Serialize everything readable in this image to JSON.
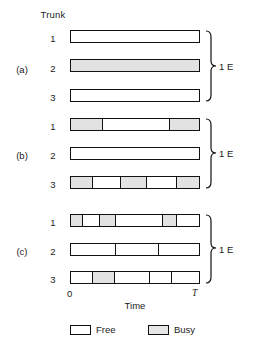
{
  "figure": {
    "trunk_header": "Trunk",
    "axis": {
      "start_label": "0",
      "end_label": "T",
      "title": "Time"
    },
    "legend": [
      {
        "label": "Free",
        "swatch": "free-swatch",
        "fill": "#ffffff"
      },
      {
        "label": "Busy",
        "swatch": "busy-swatch",
        "fill": "#e6e6e6"
      }
    ],
    "colors": {
      "busy": "#e2e2e2",
      "free": "#ffffff",
      "outline": "#111111"
    },
    "groups": [
      {
        "label": "(a)",
        "brace_label": "1 E",
        "rows": [
          {
            "trunk": "1",
            "segments": [
              {
                "state": "Free",
                "width": 100
              }
            ]
          },
          {
            "trunk": "2",
            "segments": [
              {
                "state": "Busy",
                "width": 100
              }
            ]
          },
          {
            "trunk": "3",
            "segments": [
              {
                "state": "Free",
                "width": 100
              }
            ]
          }
        ]
      },
      {
        "label": "(b)",
        "brace_label": "1 E",
        "rows": [
          {
            "trunk": "1",
            "segments": [
              {
                "state": "Busy",
                "width": 25
              },
              {
                "state": "Free",
                "width": 52
              },
              {
                "state": "Busy",
                "width": 23
              }
            ]
          },
          {
            "trunk": "2",
            "segments": [
              {
                "state": "Free",
                "width": 100
              }
            ]
          },
          {
            "trunk": "3",
            "segments": [
              {
                "state": "Busy",
                "width": 17
              },
              {
                "state": "Free",
                "width": 22
              },
              {
                "state": "Busy",
                "width": 20
              },
              {
                "state": "Free",
                "width": 24
              },
              {
                "state": "Busy",
                "width": 17
              }
            ]
          }
        ]
      },
      {
        "label": "(c)",
        "brace_label": "1 E",
        "rows": [
          {
            "trunk": "1",
            "segments": [
              {
                "state": "Busy",
                "width": 9
              },
              {
                "state": "Free",
                "width": 14
              },
              {
                "state": "Busy",
                "width": 12
              },
              {
                "state": "Free",
                "width": 37
              },
              {
                "state": "Busy",
                "width": 11
              },
              {
                "state": "Free",
                "width": 17
              }
            ]
          },
          {
            "trunk": "2",
            "segments": [
              {
                "state": "Free",
                "width": 35
              },
              {
                "state": "Free",
                "width": 34
              },
              {
                "state": "Free",
                "width": 31
              }
            ]
          },
          {
            "trunk": "3",
            "segments": [
              {
                "state": "Free",
                "width": 17
              },
              {
                "state": "Busy",
                "width": 17
              },
              {
                "state": "Free",
                "width": 28
              },
              {
                "state": "Free",
                "width": 17
              },
              {
                "state": "Free",
                "width": 21
              }
            ]
          }
        ]
      }
    ]
  }
}
